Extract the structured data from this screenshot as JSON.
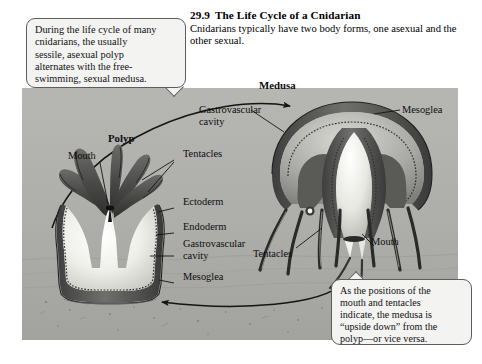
{
  "figure": {
    "number": "29.9",
    "title": "The Life Cycle of a Cnidarian",
    "subtitle_line1": "Cnidarians typically have two body forms, one",
    "subtitle_line2": "asexual and the other sexual."
  },
  "callouts": {
    "top_left": {
      "line1": "During the life cycle of many",
      "line2": "cnidarians, the usually",
      "line3": "sessile, asexual polyp",
      "line4": "alternates with the free-",
      "line5": "swimming, sexual medusa."
    },
    "bottom_right": {
      "line1": "As the positions of the",
      "line2": "mouth and tentacles",
      "line3": "indicate, the medusa is",
      "line4": "“upside down” from the",
      "line5": "polyp—or vice versa."
    }
  },
  "labels": {
    "medusa_heading": "Medusa",
    "polyp_heading": "Polyp",
    "polyp_mouth": "Mouth",
    "polyp_tentacles": "Tentacles",
    "polyp_ectoderm": "Ectoderm",
    "polyp_endoderm": "Endoderm",
    "polyp_gastrovascular": "Gastrovascular cavity",
    "polyp_mesoglea": "Mesoglea",
    "medusa_gastrovascular": "Gastrovascular cavity",
    "medusa_mesoglea": "Mesoglea",
    "medusa_tentacles": "Tentacles",
    "medusa_mouth": "Mouth"
  },
  "colors": {
    "panel_background": "#b0b0ae",
    "callout_background": "#f3f3f1",
    "callout_border": "#5d5d5d",
    "ink": "#1a1a1a",
    "tissue_dark": "#4a4a4a",
    "tissue_mid": "#8a8a88",
    "cavity_light": "#f2f2ee",
    "page_background": "#ffffff"
  }
}
